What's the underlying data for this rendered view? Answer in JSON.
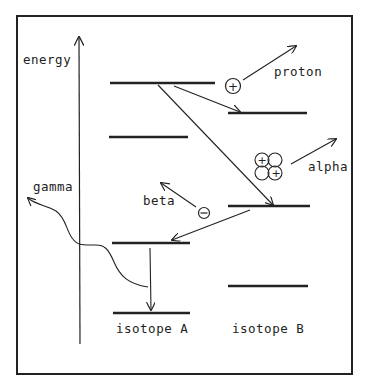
{
  "diagram": {
    "axis_label": "energy",
    "emissions": {
      "proton": "proton",
      "alpha": "alpha",
      "beta": "beta",
      "gamma": "gamma"
    },
    "particle_symbols": {
      "plus": "+",
      "minus": "−"
    },
    "isotopes": [
      {
        "label": "isotope A",
        "levels": 4
      },
      {
        "label": "isotope B",
        "levels": 3
      }
    ],
    "colors": {
      "ink": "#222222",
      "background": "#ffffff"
    }
  }
}
